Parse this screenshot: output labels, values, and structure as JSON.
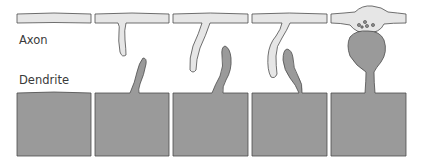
{
  "labels": {
    "axon": "Axon",
    "dendrite": "Dendrite"
  },
  "colors": {
    "background": "#ffffff",
    "axon_fill": "#e6e6e6",
    "dendrite_fill": "#9a9a9a",
    "outline": "#4d4d4d",
    "vesicle_fill": "#8a8a8a"
  },
  "panels": [
    {
      "index": 1,
      "stage": "axon and dendrite separate, no protrusions"
    },
    {
      "index": 2,
      "stage": "axon filopodium and dendritic filopodium begin to extend"
    },
    {
      "index": 3,
      "stage": "filopodia elongate toward each other"
    },
    {
      "index": 4,
      "stage": "dendritic filopodium contacts axon process"
    },
    {
      "index": 5,
      "stage": "mature synapse: dendritic spine head under axon bouton with vesicles"
    }
  ]
}
